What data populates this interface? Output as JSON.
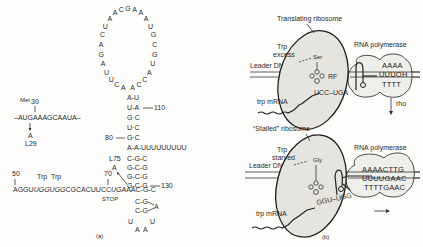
{
  "panel_a": {
    "caption": "(a)",
    "loop_bases": [
      "A",
      "C",
      "U",
      "U",
      "A",
      "G",
      "A",
      "C",
      "U",
      "A",
      "A",
      "C",
      "G",
      "A",
      "A",
      "A",
      "U",
      "G",
      "C",
      "G",
      "U",
      "A",
      "C",
      "C",
      "A"
    ],
    "stem_upper": [
      {
        "pair": "A-U",
        "label": ""
      },
      {
        "pair": "U-A",
        "label": "110"
      },
      {
        "pair": "G·C",
        "label": ""
      },
      {
        "pair": "U·C",
        "label": ""
      },
      {
        "pair": "G·C",
        "label": "80"
      }
    ],
    "terminator_tail": "A-A-UUUUUUUUU",
    "stem_lower": [
      "C-G-C",
      "G-C-G",
      "G-C-G",
      "G-C-G"
    ],
    "label_130": "130",
    "junction": "AGGUUGGUGGCGCACUUCCUGAAAC-G-C",
    "junction_parts": [
      {
        "text": "AGGU",
        "italic": false
      },
      {
        "text": "UGGUGG",
        "italic": true
      },
      {
        "text": "CGCACUUCC",
        "italic": false
      },
      {
        "text": "UGA",
        "italic": true
      },
      {
        "text": "AAC-G-C",
        "italic": false
      }
    ],
    "hairpin_bottom": [
      "C-G",
      "C-G"
    ],
    "hairpin_loop": [
      "A",
      "U",
      "U",
      "A",
      "A"
    ],
    "label_50": "50",
    "label_70": "70",
    "trp_label_1": "Trp",
    "trp_label_2": "Trp",
    "stop_label": "STOP",
    "l75_label": "L75",
    "l75_base": "A",
    "met_label": "Met",
    "met_number": "30",
    "start_seq": "–AUGAAAGCAAUA–",
    "l29_base": "A",
    "l29_label": "L29"
  },
  "panel_b": {
    "caption": "(b)",
    "top": {
      "ribosome_label": "Translating ribosome",
      "condition_line1": "Trp",
      "condition_line2": "excess",
      "leader_dna": "Leader DNA",
      "aa_label": "Ser",
      "rf_label": "RF",
      "codons": "UCC–UGA",
      "mrna_label": "trp mRNA",
      "polymerase_label": "RNA polymerase",
      "seq_lines": [
        "AAAA",
        "UUUOH",
        "TTTT"
      ],
      "rho_label": "rho"
    },
    "bottom": {
      "ribosome_label": "“Stalled” ribosome",
      "condition_line1": "Trp",
      "condition_line2": "starved",
      "leader_dna": "Leader DNA",
      "aa_label": "Gly",
      "codons": "GGU–UGG",
      "mrna_label": "trp mRNA",
      "polymerase_label": "RNA polymerase",
      "seq_lines": [
        "AAAACTTG",
        "UUUUGAAC",
        "TTTTGAAC"
      ]
    }
  }
}
